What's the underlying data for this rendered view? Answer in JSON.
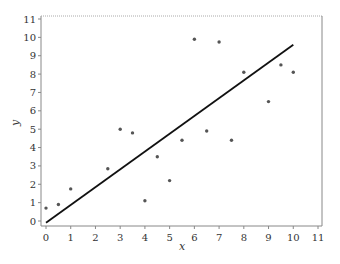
{
  "chart_data": {
    "type": "scatter",
    "title": "",
    "xlabel": "x",
    "ylabel": "y",
    "xlim": [
      0,
      11
    ],
    "ylim": [
      0,
      11
    ],
    "grid": false,
    "legend": null,
    "x_ticks": [
      0,
      1,
      2,
      3,
      4,
      5,
      6,
      7,
      8,
      9,
      10,
      11
    ],
    "y_ticks": [
      0,
      1,
      2,
      3,
      4,
      5,
      6,
      7,
      8,
      9,
      10,
      11
    ],
    "series": [
      {
        "name": "observations",
        "kind": "scatter",
        "color": "#555555",
        "points": [
          {
            "x": 0.0,
            "y": 0.7
          },
          {
            "x": 0.5,
            "y": 0.9
          },
          {
            "x": 1.0,
            "y": 1.75
          },
          {
            "x": 2.5,
            "y": 2.85
          },
          {
            "x": 3.0,
            "y": 5.0
          },
          {
            "x": 3.5,
            "y": 4.8
          },
          {
            "x": 4.0,
            "y": 1.1
          },
          {
            "x": 4.5,
            "y": 3.5
          },
          {
            "x": 5.0,
            "y": 2.2
          },
          {
            "x": 5.5,
            "y": 4.4
          },
          {
            "x": 6.0,
            "y": 9.9
          },
          {
            "x": 6.5,
            "y": 4.9
          },
          {
            "x": 7.0,
            "y": 9.75
          },
          {
            "x": 7.5,
            "y": 4.4
          },
          {
            "x": 8.0,
            "y": 8.1
          },
          {
            "x": 9.0,
            "y": 6.5
          },
          {
            "x": 9.5,
            "y": 8.5
          },
          {
            "x": 10.0,
            "y": 8.1
          }
        ]
      },
      {
        "name": "fitted line",
        "kind": "line",
        "color": "#111111",
        "points": [
          {
            "x": 0.0,
            "y": -0.1
          },
          {
            "x": 10.0,
            "y": 9.6
          }
        ]
      }
    ]
  },
  "colors": {
    "axis": "#888888",
    "frame_top": "#aaaaaa",
    "text": "#333333"
  }
}
